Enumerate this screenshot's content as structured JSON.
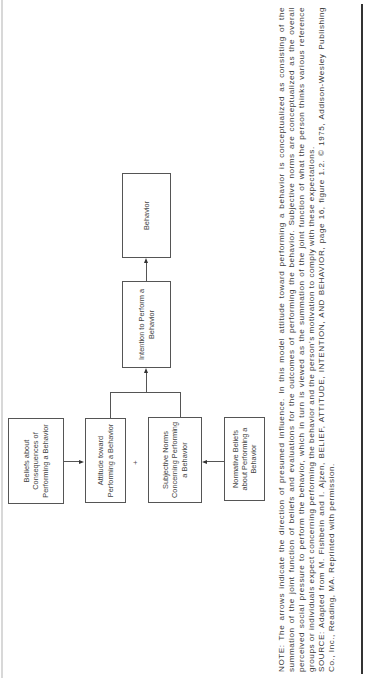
{
  "figure": {
    "boxes": {
      "beliefs": "Beliefs about Consequences of Performing a Behavior",
      "attitude": "Attitude toward Performing a Behavior",
      "subjective_norms": "Subjective Norms Concerning Performing a Behavior",
      "normative_beliefs": "Normative Beliefs about Performing a Behavior",
      "intention": "Intention to Perform a Behavior",
      "behavior": "Behavior"
    },
    "plus_sign": "+"
  },
  "caption": {
    "note": "NOTE: The arrows indicate the direction of presumed influence. In this model attitude toward performing a behavior is conceptualized as consisting of the summation of the joint function of beliefs and evaluations for the outcomes of performing the behavior. Subjective norms are conceptualized as the overall perceived social pressure to perform the behavior, which in turn is viewed as the summation of the joint function of what the person thinks various reference groups or individuals expect concerning performing the behavior and the person's motivation to comply with these expectations.",
    "source": "SOURCE: Adapted from M. Fishbein and I. Ajzen, BELIEF, ATTITUDE, INTENTION, AND BEHAVIOR, page 16, figure 1.2. © 1975, Addison-Wesley Publishing Co., Inc., Reading, MA. Reprinted with permission."
  }
}
